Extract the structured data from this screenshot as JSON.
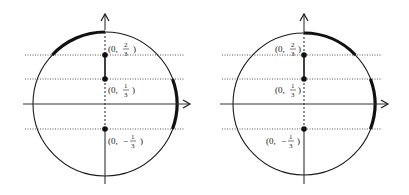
{
  "figure": {
    "background": "#ffffff",
    "stroke_color": "#1a1a1a",
    "panels": [
      {
        "id": "left",
        "circle": {
          "cx": 105,
          "cy": 104,
          "r": 72
        },
        "labels_side": "right",
        "highlighted_arcs": [
          "top-to-left at y=2/3",
          "right side between y=1/3 and y=-1/3"
        ],
        "points": [
          {
            "label_prefix": "(0,",
            "num": "2",
            "den": "3",
            "sign": "",
            "y": 55
          },
          {
            "label_prefix": "(0,",
            "num": "1",
            "den": "3",
            "sign": "",
            "y": 79
          },
          {
            "label_prefix": "(0,",
            "num": "1",
            "den": "3",
            "sign": "−",
            "y": 129
          }
        ]
      },
      {
        "id": "right",
        "circle": {
          "cx": 304,
          "cy": 104,
          "r": 72
        },
        "labels_side": "left",
        "highlighted_arcs": [
          "top-to-right at y=2/3",
          "right side between y=1/3 and y=-1/3"
        ],
        "points": [
          {
            "label_prefix": "(0,",
            "num": "2",
            "den": "3",
            "sign": "",
            "y": 55
          },
          {
            "label_prefix": "(0,",
            "num": "1",
            "den": "3",
            "sign": "",
            "y": 79
          },
          {
            "label_prefix": "(0,",
            "num": "1",
            "den": "3",
            "sign": "−",
            "y": 129
          }
        ]
      }
    ],
    "labels": {
      "left_p1": {
        "open": "(0,",
        "num": "2",
        "den": "3",
        "close": ")"
      },
      "left_p2": {
        "open": "(0,",
        "num": "1",
        "den": "3",
        "close": ")"
      },
      "left_p3": {
        "open": "(0,",
        "minus": "−",
        "num": "1",
        "den": "3",
        "close": ")"
      },
      "right_p1": {
        "open": "(0,",
        "num": "2",
        "den": "3",
        "close": ")"
      },
      "right_p2": {
        "open": "(0,",
        "num": "1",
        "den": "3",
        "close": ")"
      },
      "right_p3": {
        "open": "(0,",
        "minus": "−",
        "num": "1",
        "den": "3",
        "close": ")"
      }
    }
  }
}
